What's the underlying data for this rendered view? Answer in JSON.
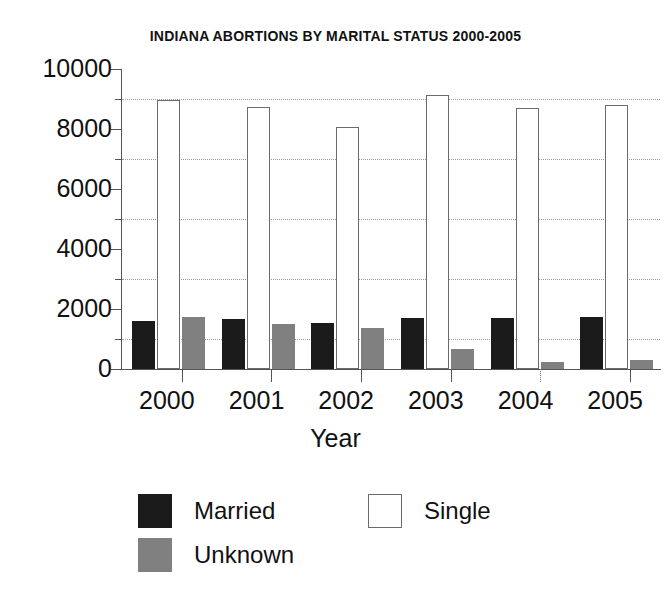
{
  "chart_data": {
    "type": "bar",
    "title": "INDIANA ABORTIONS BY MARITAL STATUS 2000-2005",
    "xlabel": "Year",
    "ylabel": "",
    "categories": [
      "2000",
      "2001",
      "2002",
      "2003",
      "2004",
      "2005"
    ],
    "series": [
      {
        "name": "Married",
        "color": "#1b1b1b",
        "values": [
          1600,
          1680,
          1530,
          1700,
          1700,
          1720
        ]
      },
      {
        "name": "Single",
        "color": "#ffffff",
        "values": [
          8970,
          8750,
          8080,
          9130,
          8700,
          8800
        ]
      },
      {
        "name": "Unknown",
        "color": "#808080",
        "values": [
          1750,
          1500,
          1360,
          680,
          230,
          300
        ]
      }
    ],
    "ylim": [
      0,
      10000
    ],
    "ytick_labels": [
      "0",
      "2000",
      "4000",
      "6000",
      "8000",
      "10000"
    ],
    "ytick_values": [
      0,
      2000,
      4000,
      6000,
      8000,
      10000
    ],
    "minor_tick_values": [
      1000,
      3000,
      5000,
      7000,
      9000
    ],
    "gridlines": [
      1000,
      3000,
      5000,
      7000,
      9000
    ],
    "grid": true,
    "legend_position": "bottom",
    "legend_entries": [
      {
        "label": "Married",
        "swatch": "black-filled"
      },
      {
        "label": "Single",
        "swatch": "white-outline"
      },
      {
        "label": "Unknown",
        "swatch": "gray-filled"
      }
    ]
  }
}
